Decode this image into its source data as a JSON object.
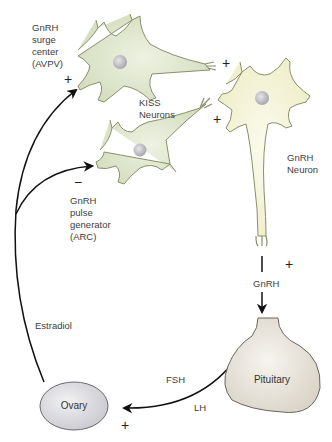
{
  "diagram": {
    "nodes": {
      "surge_center": {
        "label": "GnRH\nsurge\ncenter\n(AVPV)",
        "sign": "+"
      },
      "kiss_neurons": {
        "label": "KISS\nNeurons"
      },
      "gnrh_neuron": {
        "label": "GnRH\nNeuron"
      },
      "pulse_generator": {
        "label": "GnRH\npulse\ngenerator\n(ARC)",
        "sign": "−"
      },
      "pituitary": {
        "label": "Pituitary",
        "sign": "+"
      },
      "ovary": {
        "label": "Ovary",
        "sign": "+"
      }
    },
    "synapse_signs": {
      "upper": "+",
      "lower": "+"
    },
    "edges": {
      "gnrh": {
        "label": "GnRH"
      },
      "estradiol": {
        "label": "Estradiol"
      },
      "fsh": {
        "label": "FSH"
      },
      "lh": {
        "label": "LH"
      }
    },
    "colors": {
      "kiss_neuron_fill": "#dfe6cf",
      "gnrh_neuron_fill": "#f4f3dc",
      "neuron_outline": "#8a8f6a",
      "nucleus": "#c8c8cc",
      "pituitary_fill": "#ebe7df",
      "ovary_fill": "#e3e3e6",
      "arrow": "#111111"
    }
  }
}
